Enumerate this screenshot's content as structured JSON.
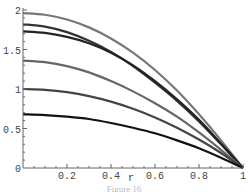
{
  "chart_data": {
    "type": "line",
    "title": "",
    "xlabel": "r",
    "ylabel": "",
    "xlim": [
      0,
      1
    ],
    "ylim": [
      0,
      2
    ],
    "grid": false,
    "legend": null,
    "x_ticks": [
      "0.2",
      "0.4",
      "0.6",
      "0.8",
      "1"
    ],
    "y_ticks": [
      "0",
      "0.5",
      "1",
      "1.5",
      "2"
    ],
    "x": [
      0,
      0.1,
      0.2,
      0.3,
      0.4,
      0.5,
      0.6,
      0.7,
      0.8,
      0.9,
      1.0
    ],
    "series": [
      {
        "name": "curve-1",
        "color": "#777777",
        "values": [
          1.96,
          1.94,
          1.88,
          1.78,
          1.64,
          1.46,
          1.24,
          0.98,
          0.68,
          0.35,
          0.0
        ]
      },
      {
        "name": "curve-2",
        "color": "#333333",
        "values": [
          1.82,
          1.79,
          1.72,
          1.61,
          1.47,
          1.29,
          1.08,
          0.85,
          0.59,
          0.3,
          0.0
        ]
      },
      {
        "name": "curve-3",
        "color": "#222222",
        "values": [
          1.73,
          1.71,
          1.66,
          1.58,
          1.46,
          1.3,
          1.1,
          0.87,
          0.61,
          0.31,
          0.0
        ]
      },
      {
        "name": "curve-4",
        "color": "#666666",
        "values": [
          1.36,
          1.34,
          1.29,
          1.21,
          1.1,
          0.97,
          0.82,
          0.65,
          0.45,
          0.23,
          0.0
        ]
      },
      {
        "name": "curve-5",
        "color": "#444444",
        "values": [
          1.0,
          0.99,
          0.96,
          0.91,
          0.84,
          0.75,
          0.64,
          0.51,
          0.36,
          0.19,
          0.0
        ]
      },
      {
        "name": "curve-6",
        "color": "#111111",
        "values": [
          0.68,
          0.67,
          0.65,
          0.62,
          0.57,
          0.51,
          0.44,
          0.35,
          0.25,
          0.13,
          0.0
        ]
      }
    ]
  },
  "caption": "Figure 16"
}
